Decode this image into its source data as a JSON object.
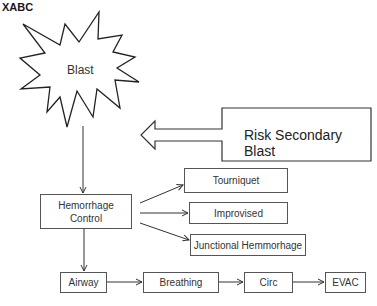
{
  "title": "XABC",
  "blast": {
    "label": "Blast",
    "icon": "explosion-star-icon"
  },
  "secondary": {
    "label": "Risk Secondary Blast",
    "icon": "left-block-arrow-icon"
  },
  "hemorrhage": {
    "label_line1": "Hemorrhage",
    "label_line2": "Control"
  },
  "interventions": [
    {
      "label": "Tourniquet"
    },
    {
      "label": "Improvised"
    },
    {
      "label": "Junctional Hemmorhage"
    }
  ],
  "sequence": [
    {
      "label": "Airway"
    },
    {
      "label": "Breathing"
    },
    {
      "label": "Circ"
    },
    {
      "label": "EVAC"
    }
  ],
  "colors": {
    "stroke": "#333333",
    "background": "#ffffff"
  }
}
